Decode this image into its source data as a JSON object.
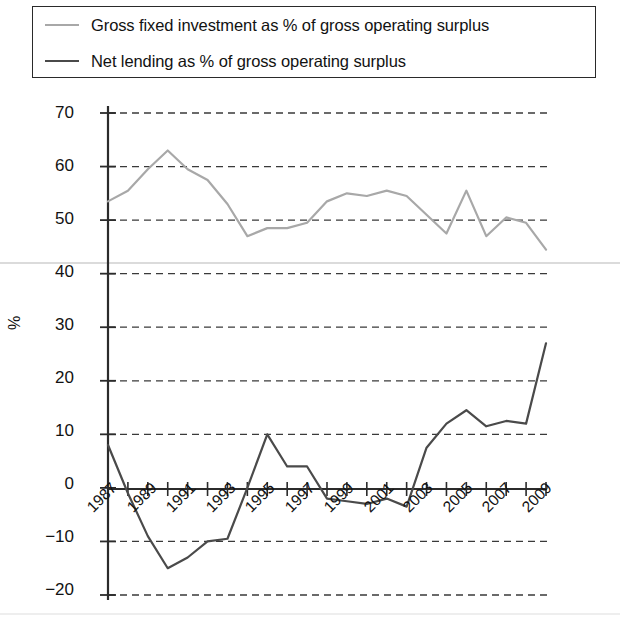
{
  "legend": {
    "position": "top",
    "entries": [
      {
        "label": "Gross fixed investment as % of gross operating surplus",
        "color": "#a8a8a8",
        "swatch": "line-swatch-light"
      },
      {
        "label": "Net lending as % of gross operating surplus",
        "color": "#4a4a4a",
        "swatch": "line-swatch-dark"
      }
    ]
  },
  "axes": {
    "ylabel": "%",
    "yticks": [
      "70",
      "60",
      "50",
      "40",
      "30",
      "20",
      "10",
      "0",
      "−10",
      "−20"
    ],
    "xticks": [
      "1987",
      "1989",
      "1991",
      "1993",
      "1995",
      "1997",
      "1999",
      "2001",
      "2003",
      "2005",
      "2007",
      "2009"
    ]
  },
  "chart_data": {
    "type": "line",
    "title": "",
    "xlabel": "",
    "ylabel": "%",
    "ylim": [
      -20,
      70
    ],
    "xlim": [
      1987,
      2009
    ],
    "grid": true,
    "legend_position": "top",
    "x": [
      1987,
      1988,
      1989,
      1990,
      1991,
      1992,
      1993,
      1994,
      1995,
      1996,
      1997,
      1998,
      1999,
      2000,
      2001,
      2002,
      2003,
      2004,
      2005,
      2006,
      2007,
      2008,
      2009
    ],
    "series": [
      {
        "name": "Gross fixed investment as % of gross operating surplus",
        "color": "#a8a8a8",
        "values": [
          53.5,
          55.5,
          59.5,
          63.0,
          59.5,
          57.5,
          53.0,
          47.0,
          48.5,
          48.5,
          49.5,
          53.5,
          55.0,
          54.5,
          55.5,
          54.5,
          51.0,
          47.5,
          55.5,
          47.0,
          50.5,
          49.5,
          44.5
        ]
      },
      {
        "name": "Net lending as % of gross operating surplus",
        "color": "#4a4a4a",
        "values": [
          8.0,
          -1.0,
          -9.0,
          -15.0,
          -13.0,
          -10.0,
          -9.5,
          0.0,
          10.0,
          4.0,
          4.0,
          -2.0,
          -2.5,
          -3.0,
          -2.0,
          -3.5,
          7.5,
          12.0,
          14.5,
          11.5,
          12.5,
          12.0,
          27.0
        ]
      }
    ]
  }
}
